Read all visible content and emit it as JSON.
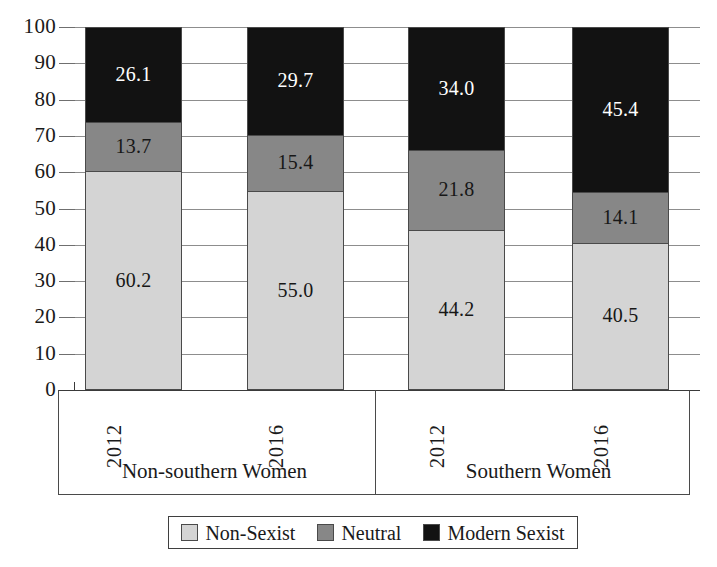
{
  "chart_data": {
    "type": "bar",
    "subtype": "stacked-bar-100",
    "title": "",
    "xlabel": "",
    "ylabel": "",
    "ylim": [
      0,
      100
    ],
    "ytick_step": 10,
    "yticks": [
      100,
      90,
      80,
      70,
      60,
      50,
      40,
      30,
      20,
      10,
      0
    ],
    "grid": true,
    "legend_position": "bottom",
    "groups": [
      "Non-southern Women",
      "Southern Women"
    ],
    "categories": [
      "2012",
      "2016",
      "2012",
      "2016"
    ],
    "series": [
      {
        "name": "Non-Sexist",
        "color": "#d4d4d4",
        "values": [
          60.2,
          55.0,
          44.2,
          40.5
        ]
      },
      {
        "name": "Neutral",
        "color": "#878787",
        "values": [
          13.7,
          15.4,
          21.8,
          14.1
        ]
      },
      {
        "name": "Modern Sexist",
        "color": "#121212",
        "values": [
          26.1,
          29.7,
          34.0,
          45.4
        ]
      }
    ],
    "bars": [
      {
        "group": "Non-southern Women",
        "year": "2012",
        "segments": [
          {
            "series": "Modern Sexist",
            "value": 26.1,
            "label": "26.1"
          },
          {
            "series": "Neutral",
            "value": 13.7,
            "label": "13.7"
          },
          {
            "series": "Non-Sexist",
            "value": 60.2,
            "label": "60.2"
          }
        ]
      },
      {
        "group": "Non-southern Women",
        "year": "2016",
        "segments": [
          {
            "series": "Modern Sexist",
            "value": 29.7,
            "label": "29.7"
          },
          {
            "series": "Neutral",
            "value": 15.4,
            "label": "15.4"
          },
          {
            "series": "Non-Sexist",
            "value": 55.0,
            "label": "55.0"
          }
        ]
      },
      {
        "group": "Southern Women",
        "year": "2012",
        "segments": [
          {
            "series": "Modern Sexist",
            "value": 34.0,
            "label": "34.0"
          },
          {
            "series": "Neutral",
            "value": 21.8,
            "label": "21.8"
          },
          {
            "series": "Non-Sexist",
            "value": 44.2,
            "label": "44.2"
          }
        ]
      },
      {
        "group": "Southern Women",
        "year": "2016",
        "segments": [
          {
            "series": "Modern Sexist",
            "value": 45.4,
            "label": "45.4"
          },
          {
            "series": "Neutral",
            "value": 14.1,
            "label": "14.1"
          },
          {
            "series": "Non-Sexist",
            "value": 40.5,
            "label": "40.5"
          }
        ]
      }
    ]
  },
  "axis": {
    "yticks": [
      "100",
      "90",
      "80",
      "70",
      "60",
      "50",
      "40",
      "30",
      "20",
      "10",
      "0"
    ]
  },
  "groups": [
    {
      "label": "Non-southern Women"
    },
    {
      "label": "Southern Women"
    }
  ],
  "bars": [
    {
      "year": "2012"
    },
    {
      "year": "2016"
    },
    {
      "year": "2012"
    },
    {
      "year": "2016"
    }
  ],
  "legend": {
    "items": [
      {
        "label": "Non-Sexist",
        "color": "#d4d4d4"
      },
      {
        "label": "Neutral",
        "color": "#878787"
      },
      {
        "label": "Modern Sexist",
        "color": "#121212"
      }
    ]
  }
}
